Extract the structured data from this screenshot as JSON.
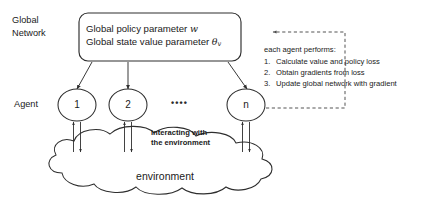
{
  "labels": {
    "global_network_line1": "Global",
    "global_network_line2": "Network",
    "agent": "Agent",
    "environment": "environment",
    "interacting_line1": "interacting with",
    "interacting_line2": "the environment",
    "agents_ellipsis": "••••"
  },
  "global_box": {
    "policy_prefix": "Global policy parameter ",
    "policy_symbol": "w",
    "value_prefix": "Global state value parameter ",
    "value_symbol": "θ",
    "value_subscript": "v"
  },
  "agents": [
    {
      "id": "agent-1",
      "label": "1"
    },
    {
      "id": "agent-2",
      "label": "2"
    },
    {
      "id": "agent-n",
      "label": "n"
    }
  ],
  "procedure": {
    "heading": "each agent performs:",
    "steps": [
      {
        "index": "1.",
        "text": "Calculate value and policy loss"
      },
      {
        "index": "2.",
        "text": "Obtain gradients from loss"
      },
      {
        "index": "3.",
        "text": "Update global network with gradient"
      }
    ]
  },
  "icons": {
    "global_box": "rounded-rectangle-shape",
    "agent_node": "circle-node-shape",
    "environment": "cloud-shape",
    "download_arrow": "arrow-down-icon",
    "feedback_arrow": "dashed-feedback-arrow-icon",
    "interaction_arrows": "bidirectional-arrow-pair-icon"
  },
  "colors": {
    "stroke": "#2e2e2e",
    "text": "#1a1a1a",
    "background": "#ffffff",
    "dashed_stroke": "#4a4a4a"
  }
}
